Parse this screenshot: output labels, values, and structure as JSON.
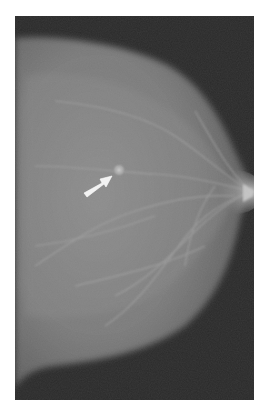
{
  "image": {
    "kind": "mammogram",
    "view": "lateral / mediolateral",
    "background_color": "#2a2a2a",
    "page_background": "#ffffff",
    "tissue_color_center": "#8a8a8a",
    "tissue_color_edge": "#5c5c5c",
    "arrow_color": "#f2f2f2"
  },
  "annotations": [
    {
      "type": "arrow",
      "icon": "arrow-icon",
      "direction": "up-right",
      "points_to": "focal density",
      "color": "#f2f2f2"
    }
  ],
  "findings": [
    {
      "label": "focal-density",
      "description": "small bright rounded opacity indicated by arrow"
    }
  ]
}
